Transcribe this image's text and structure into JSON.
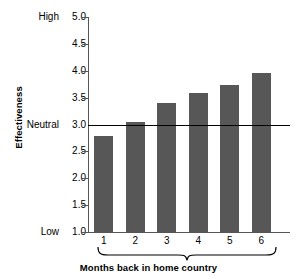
{
  "chart_data": {
    "type": "bar",
    "title": "",
    "subtitle": "",
    "xlabel": "Months back in home country",
    "ylabel": "Effectiveness",
    "categories": [
      "1",
      "2",
      "3",
      "4",
      "5",
      "6"
    ],
    "values": [
      2.79,
      3.05,
      3.4,
      3.58,
      3.74,
      3.95
    ],
    "series": [
      {
        "name": "Effectiveness",
        "values": [
          2.79,
          3.05,
          3.4,
          3.58,
          3.74,
          3.95
        ]
      }
    ],
    "ylim": [
      1.0,
      5.0
    ],
    "ytick_values": [
      5.0,
      4.5,
      4.0,
      3.5,
      3.0,
      2.5,
      2.0,
      1.5,
      1.0
    ],
    "ytick_labels": [
      "5.0",
      "4.5",
      "4.0",
      "3.5",
      "3.0",
      "2.5",
      "2.0",
      "1.5",
      "1.0"
    ],
    "ytick_anchor_words": {
      "5.0": "High",
      "3.0": "Neutral",
      "1.0": "Low"
    },
    "annotations": [
      {
        "name": "neutral-reference-line",
        "value": 3.0,
        "label": "Neutral",
        "orientation": "horizontal"
      },
      {
        "name": "category-brace",
        "label": "Months back in home country",
        "spans": [
          "1",
          "6"
        ]
      }
    ],
    "grid": false,
    "legend": false,
    "legend_position": "none",
    "bar_color": "#575757",
    "axis_color": "#555555",
    "reference_line_color": "#000000",
    "background_color": "#ffffff"
  },
  "axis": {
    "y_label": "Effectiveness",
    "x_label": "Months back in home country",
    "high_label": "High",
    "neutral_label": "Neutral",
    "low_label": "Low"
  }
}
